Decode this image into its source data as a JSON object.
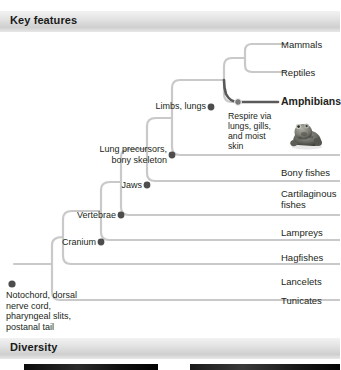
{
  "sections": {
    "key_features": "Key features",
    "diversity": "Diversity"
  },
  "tree": {
    "tips": [
      {
        "name": "mammals",
        "label": "Mammals",
        "y": 44,
        "highlight": false
      },
      {
        "name": "reptiles",
        "label": "Reptiles",
        "y": 72,
        "highlight": false
      },
      {
        "name": "amphibians",
        "label": "Amphibians",
        "y": 102,
        "highlight": true
      },
      {
        "name": "bony-fishes",
        "label": "Bony fishes",
        "y": 172,
        "highlight": false
      },
      {
        "name": "cartilaginous-fishes",
        "label": "Cartilaginous fishes",
        "y": 198,
        "highlight": false
      },
      {
        "name": "lampreys",
        "label": "Lampreys",
        "y": 232,
        "highlight": false
      },
      {
        "name": "hagfishes",
        "label": "Hagfishes",
        "y": 257,
        "highlight": false
      },
      {
        "name": "lancelets",
        "label": "Lancelets",
        "y": 281,
        "highlight": false
      },
      {
        "name": "tunicates",
        "label": "Tunicates",
        "y": 300,
        "highlight": false
      }
    ],
    "nodes": [
      {
        "name": "limbs-lungs",
        "label": "Limbs, lungs",
        "x": 211,
        "y": 107
      },
      {
        "name": "lung-precursors",
        "label": "Lung precursors, bony skeleton",
        "x": 172,
        "y": 155
      },
      {
        "name": "jaws",
        "label": "Jaws",
        "x": 147,
        "y": 185
      },
      {
        "name": "vertebrae",
        "label": "Vertebrae",
        "x": 121,
        "y": 215
      },
      {
        "name": "cranium",
        "label": "Cranium",
        "x": 101,
        "y": 242
      },
      {
        "name": "notochord",
        "label": "Notochord, dorsal nerve cord, pharyngeal slits, postanal tail",
        "x": 12,
        "y": 284
      }
    ],
    "annotation": {
      "name": "amphibian-respiration-note",
      "label": "Respire via lungs, gills, and moist skin"
    },
    "photo": {
      "name": "frog-photo",
      "caption": "frog"
    }
  },
  "colors": {
    "branch": "#c9c9c9",
    "branch_highlight": "#5a5a5a",
    "node": "#4d4d4d",
    "text": "#231f20",
    "bar_light": "#f2f2f2",
    "bar_dark": "#cfcfcf"
  }
}
